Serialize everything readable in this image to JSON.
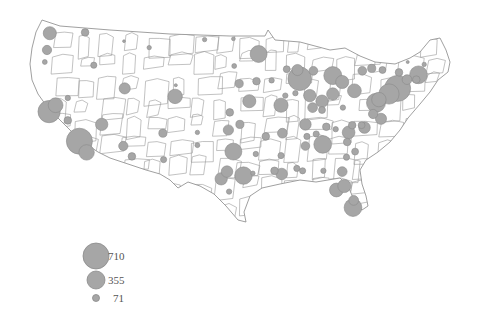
{
  "map": {
    "subject": "United States sub-regions with proportional circles",
    "bubble_fill": "#a6a6a6",
    "bubble_stroke": "#8a8a8a",
    "border_color": "#888888",
    "land_fill": "#ffffff",
    "bubbles": [
      {
        "lon": -122.3,
        "lat": 47.6,
        "v": 180
      },
      {
        "lon": -117.4,
        "lat": 47.7,
        "v": 60
      },
      {
        "lon": -122.7,
        "lat": 45.5,
        "v": 90
      },
      {
        "lon": -123.0,
        "lat": 44.0,
        "v": 25
      },
      {
        "lon": -116.2,
        "lat": 43.6,
        "v": 40
      },
      {
        "lon": -112.0,
        "lat": 46.6,
        "v": 8
      },
      {
        "lon": -108.5,
        "lat": 45.8,
        "v": 20
      },
      {
        "lon": -111.9,
        "lat": 40.7,
        "v": 130
      },
      {
        "lon": -119.8,
        "lat": 39.5,
        "v": 30
      },
      {
        "lon": -122.4,
        "lat": 37.8,
        "v": 520
      },
      {
        "lon": -121.5,
        "lat": 38.6,
        "v": 230
      },
      {
        "lon": -119.8,
        "lat": 36.7,
        "v": 60
      },
      {
        "lon": -118.2,
        "lat": 34.1,
        "v": 710
      },
      {
        "lon": -117.2,
        "lat": 32.7,
        "v": 250
      },
      {
        "lon": -115.1,
        "lat": 36.2,
        "v": 160
      },
      {
        "lon": -112.1,
        "lat": 33.5,
        "v": 90
      },
      {
        "lon": -110.9,
        "lat": 32.2,
        "v": 60
      },
      {
        "lon": -106.6,
        "lat": 35.1,
        "v": 70
      },
      {
        "lon": -106.5,
        "lat": 31.8,
        "v": 40
      },
      {
        "lon": -104.9,
        "lat": 39.7,
        "v": 220
      },
      {
        "lon": -104.8,
        "lat": 41.1,
        "v": 10
      },
      {
        "lon": -100.8,
        "lat": 46.8,
        "v": 20
      },
      {
        "lon": -96.8,
        "lat": 46.9,
        "v": 15
      },
      {
        "lon": -93.3,
        "lat": 45.0,
        "v": 300
      },
      {
        "lon": -96.7,
        "lat": 43.5,
        "v": 25
      },
      {
        "lon": -96.0,
        "lat": 41.3,
        "v": 70
      },
      {
        "lon": -93.6,
        "lat": 41.6,
        "v": 60
      },
      {
        "lon": -97.3,
        "lat": 37.7,
        "v": 60
      },
      {
        "lon": -94.6,
        "lat": 39.1,
        "v": 180
      },
      {
        "lon": -90.2,
        "lat": 38.6,
        "v": 210
      },
      {
        "lon": -97.5,
        "lat": 35.5,
        "v": 110
      },
      {
        "lon": -95.9,
        "lat": 36.2,
        "v": 70
      },
      {
        "lon": -96.8,
        "lat": 32.8,
        "v": 300
      },
      {
        "lon": -97.7,
        "lat": 30.3,
        "v": 140
      },
      {
        "lon": -98.5,
        "lat": 29.4,
        "v": 160
      },
      {
        "lon": -95.4,
        "lat": 29.8,
        "v": 320
      },
      {
        "lon": -101.8,
        "lat": 33.6,
        "v": 25
      },
      {
        "lon": -101.8,
        "lat": 35.2,
        "v": 20
      },
      {
        "lon": -97.4,
        "lat": 27.8,
        "v": 30
      },
      {
        "lon": -94.1,
        "lat": 30.1,
        "v": 20
      },
      {
        "lon": -93.7,
        "lat": 32.5,
        "v": 30
      },
      {
        "lon": -92.3,
        "lat": 34.7,
        "v": 60
      },
      {
        "lon": -91.1,
        "lat": 30.4,
        "v": 60
      },
      {
        "lon": -90.1,
        "lat": 30.0,
        "v": 140
      },
      {
        "lon": -90.2,
        "lat": 32.3,
        "v": 40
      },
      {
        "lon": -88.0,
        "lat": 30.7,
        "v": 40
      },
      {
        "lon": -86.8,
        "lat": 33.5,
        "v": 80
      },
      {
        "lon": -86.8,
        "lat": 36.2,
        "v": 140
      },
      {
        "lon": -90.0,
        "lat": 35.1,
        "v": 100
      },
      {
        "lon": -85.8,
        "lat": 38.3,
        "v": 100
      },
      {
        "lon": -84.5,
        "lat": 39.1,
        "v": 160
      },
      {
        "lon": -83.0,
        "lat": 40.0,
        "v": 160
      },
      {
        "lon": -81.7,
        "lat": 41.5,
        "v": 180
      },
      {
        "lon": -83.0,
        "lat": 42.3,
        "v": 340
      },
      {
        "lon": -85.7,
        "lat": 42.9,
        "v": 80
      },
      {
        "lon": -87.6,
        "lat": 41.9,
        "v": 580
      },
      {
        "lon": -87.9,
        "lat": 43.0,
        "v": 130
      },
      {
        "lon": -89.4,
        "lat": 43.1,
        "v": 50
      },
      {
        "lon": -86.2,
        "lat": 39.8,
        "v": 160
      },
      {
        "lon": -88.2,
        "lat": 40.1,
        "v": 30
      },
      {
        "lon": -89.6,
        "lat": 39.8,
        "v": 30
      },
      {
        "lon": -91.5,
        "lat": 41.7,
        "v": 30
      },
      {
        "lon": -80.0,
        "lat": 40.4,
        "v": 200
      },
      {
        "lon": -84.4,
        "lat": 33.7,
        "v": 330
      },
      {
        "lon": -81.1,
        "lat": 32.1,
        "v": 40
      },
      {
        "lon": -80.8,
        "lat": 35.2,
        "v": 170
      },
      {
        "lon": -78.6,
        "lat": 35.8,
        "v": 140
      },
      {
        "lon": -79.9,
        "lat": 32.8,
        "v": 50
      },
      {
        "lon": -81.0,
        "lat": 34.0,
        "v": 60
      },
      {
        "lon": -77.4,
        "lat": 37.5,
        "v": 90
      },
      {
        "lon": -76.3,
        "lat": 36.9,
        "v": 130
      },
      {
        "lon": -77.0,
        "lat": 38.9,
        "v": 380
      },
      {
        "lon": -76.6,
        "lat": 39.3,
        "v": 220
      },
      {
        "lon": -75.2,
        "lat": 40.0,
        "v": 430
      },
      {
        "lon": -74.0,
        "lat": 40.7,
        "v": 710
      },
      {
        "lon": -73.8,
        "lat": 42.7,
        "v": 60
      },
      {
        "lon": -76.1,
        "lat": 43.0,
        "v": 50
      },
      {
        "lon": -77.6,
        "lat": 43.2,
        "v": 70
      },
      {
        "lon": -78.9,
        "lat": 42.9,
        "v": 80
      },
      {
        "lon": -72.7,
        "lat": 41.8,
        "v": 100
      },
      {
        "lon": -71.1,
        "lat": 42.4,
        "v": 330
      },
      {
        "lon": -71.4,
        "lat": 41.8,
        "v": 60
      },
      {
        "lon": -70.3,
        "lat": 43.7,
        "v": 20
      },
      {
        "lon": -72.6,
        "lat": 44.0,
        "v": 10
      },
      {
        "lon": -81.7,
        "lat": 30.3,
        "v": 100
      },
      {
        "lon": -81.4,
        "lat": 28.5,
        "v": 180
      },
      {
        "lon": -82.5,
        "lat": 28.0,
        "v": 200
      },
      {
        "lon": -80.2,
        "lat": 25.8,
        "v": 330
      },
      {
        "lon": -80.1,
        "lat": 26.7,
        "v": 100
      },
      {
        "lon": -84.3,
        "lat": 30.4,
        "v": 30
      },
      {
        "lon": -87.2,
        "lat": 30.4,
        "v": 40
      },
      {
        "lon": -86.6,
        "lat": 34.7,
        "v": 40
      },
      {
        "lon": -85.3,
        "lat": 35.0,
        "v": 40
      },
      {
        "lon": -83.9,
        "lat": 35.9,
        "v": 60
      },
      {
        "lon": -82.6,
        "lat": 35.6,
        "v": 30
      },
      {
        "lon": -84.5,
        "lat": 38.0,
        "v": 50
      },
      {
        "lon": -81.6,
        "lat": 38.3,
        "v": 30
      },
      {
        "lon": -79.0,
        "lat": 36.1,
        "v": 50
      },
      {
        "lon": -80.3,
        "lat": 36.1,
        "v": 60
      }
    ]
  },
  "legend": {
    "items": [
      {
        "value": 710,
        "label": "710"
      },
      {
        "value": 355,
        "label": "355"
      },
      {
        "value": 71,
        "label": "71"
      }
    ]
  }
}
